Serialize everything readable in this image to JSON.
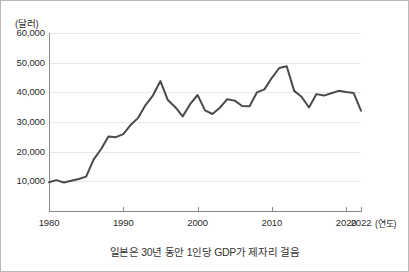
{
  "chart_data": {
    "type": "line",
    "title": "",
    "caption": "일본은 30년 동안 1인당 GDP가 제자리 걸음",
    "xlabel": "(연도)",
    "ylabel": "(달러)",
    "xlim": [
      1980,
      2022
    ],
    "ylim": [
      0,
      60000
    ],
    "grid": true,
    "legend": "none",
    "y_ticks": [
      10000,
      20000,
      30000,
      40000,
      50000,
      60000
    ],
    "y_tick_labels": [
      "10,000",
      "20,000",
      "30,000",
      "40,000",
      "50,000",
      "60,000"
    ],
    "x_ticks": [
      1980,
      1990,
      2000,
      2010,
      2020,
      2022
    ],
    "x_tick_labels": [
      "1980",
      "1990",
      "2000",
      "2010",
      "2020",
      "2022"
    ],
    "line_color": "#4a4a4a",
    "series": [
      {
        "name": "Japan GDP per capita",
        "x": [
          1980,
          1981,
          1982,
          1983,
          1984,
          1985,
          1986,
          1987,
          1988,
          1989,
          1990,
          1991,
          1992,
          1993,
          1994,
          1995,
          1996,
          1997,
          1998,
          1999,
          2000,
          2001,
          2002,
          2003,
          2004,
          2005,
          2006,
          2007,
          2008,
          2009,
          2010,
          2011,
          2012,
          2013,
          2014,
          2015,
          2016,
          2017,
          2018,
          2019,
          2020,
          2021,
          2022
        ],
        "values": [
          9700,
          10400,
          9600,
          10200,
          10800,
          11600,
          17300,
          20800,
          25100,
          24900,
          25900,
          29000,
          31400,
          35700,
          39000,
          43800,
          37400,
          35000,
          31900,
          36000,
          39100,
          33900,
          32700,
          34800,
          37700,
          37200,
          35400,
          35300,
          40000,
          41000,
          44900,
          48200,
          48800,
          40500,
          38500,
          34900,
          39400,
          38900,
          39700,
          40500,
          40100,
          39800,
          33800
        ]
      }
    ]
  },
  "axis": {
    "y_unit_label": "(달러)",
    "x_unit_label": "(연도)"
  }
}
